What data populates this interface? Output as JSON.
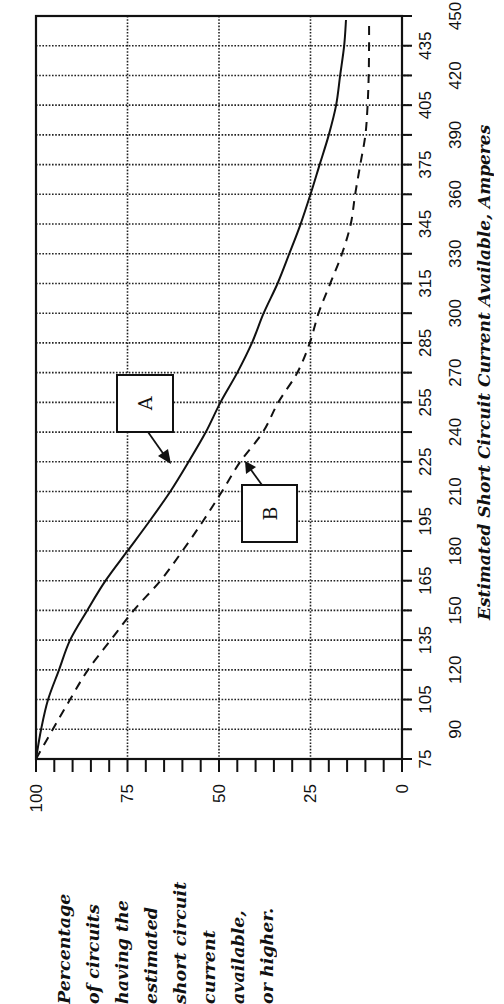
{
  "chart_data": {
    "type": "line",
    "orientation": "rotated-90-ccw",
    "title": "",
    "xlabel": "Estimated Short Circuit Current Available, Amperes",
    "ylabel": "Percentage of circuits having the estimated short circuit current available, or higher.",
    "ylabel_lines": [
      "Percentage",
      "of circuits",
      "having the",
      "estimated",
      "short circuit",
      "current",
      "available,",
      "or higher."
    ],
    "xlim": [
      75,
      450
    ],
    "ylim": [
      0,
      100
    ],
    "x_ticks": [
      75,
      90,
      105,
      120,
      135,
      150,
      165,
      180,
      195,
      210,
      225,
      240,
      255,
      270,
      285,
      300,
      315,
      330,
      345,
      360,
      375,
      390,
      405,
      420,
      435,
      450
    ],
    "y_ticks": [
      0,
      25,
      50,
      75,
      100
    ],
    "y_minor_step": 5,
    "grid": true,
    "grid_style": "dotted",
    "x": [
      75,
      90,
      105,
      120,
      135,
      150,
      165,
      180,
      195,
      210,
      225,
      240,
      255,
      270,
      285,
      300,
      315,
      330,
      345,
      360,
      375,
      390,
      405,
      420,
      435,
      448
    ],
    "series": [
      {
        "name": "A",
        "line_style": "solid",
        "values": [
          100,
          98.6,
          96.7,
          93.7,
          90.7,
          86,
          81,
          75,
          69,
          63.3,
          58.3,
          53.6,
          49.6,
          45,
          41,
          37.8,
          34,
          30.8,
          27.7,
          25,
          22.5,
          20,
          18,
          16.9,
          15.8,
          15.3
        ]
      },
      {
        "name": "B",
        "line_style": "dashed",
        "values": [
          100,
          95.4,
          90.7,
          85.8,
          79.6,
          73.3,
          66,
          60,
          54.4,
          49.2,
          44.2,
          38,
          33.8,
          28.6,
          25.2,
          22.8,
          19.6,
          16.4,
          14,
          12.8,
          11.4,
          10,
          9.4,
          9.1,
          9,
          9
        ]
      }
    ],
    "annotations": [
      {
        "label": "A",
        "points_to_series": "A"
      },
      {
        "label": "B",
        "points_to_series": "B"
      }
    ],
    "legend": "none (callout boxes A and B with arrows)"
  },
  "colors": {
    "ink": "#111111",
    "background": "#ffffff"
  }
}
